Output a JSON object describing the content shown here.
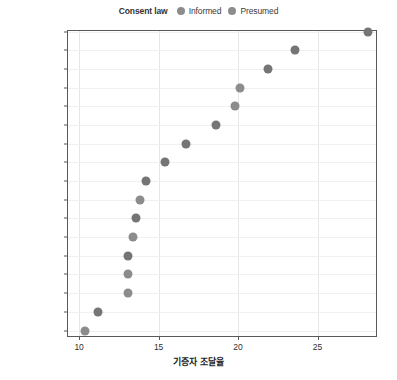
{
  "legend": {
    "title": "Consent law",
    "entries": [
      {
        "label": "Informed",
        "color": "#8c8c8c"
      },
      {
        "label": "Presumed",
        "color": "#8c8c8c"
      }
    ]
  },
  "axis": {
    "x_title": "기증자 조달율",
    "x_ticks": [
      "10",
      "15",
      "20",
      "25"
    ]
  },
  "chart_data": {
    "type": "scatter",
    "title": "",
    "xlabel": "기증자 조달율",
    "ylabel": "",
    "xlim": [
      9.3,
      28.8
    ],
    "grid": true,
    "legend_position": "top-center",
    "legend_title": "Consent law",
    "series": [
      {
        "name": "Informed",
        "color": "#8c8c8c"
      },
      {
        "name": "Presumed",
        "color": "#757575"
      }
    ],
    "categories": [
      "Spain",
      "Austria",
      "Belgium",
      "United States",
      "Ireland",
      "Finland",
      "France",
      "Norway",
      "Switzerland",
      "Canada",
      "Netherlands",
      "United Kingdom",
      "Sweden",
      "Denmark",
      "Germany",
      "Italy",
      "Australia"
    ],
    "points": [
      {
        "country": "Spain",
        "value": 28.2,
        "consent": "Presumed"
      },
      {
        "country": "Austria",
        "value": 23.6,
        "consent": "Presumed"
      },
      {
        "country": "Belgium",
        "value": 21.9,
        "consent": "Presumed"
      },
      {
        "country": "United States",
        "value": 20.1,
        "consent": "Informed"
      },
      {
        "country": "Ireland",
        "value": 19.8,
        "consent": "Informed"
      },
      {
        "country": "Finland",
        "value": 18.6,
        "consent": "Presumed"
      },
      {
        "country": "France",
        "value": 16.7,
        "consent": "Presumed"
      },
      {
        "country": "Norway",
        "value": 15.4,
        "consent": "Presumed"
      },
      {
        "country": "Switzerland",
        "value": 14.2,
        "consent": "Presumed"
      },
      {
        "country": "Canada",
        "value": 13.8,
        "consent": "Informed"
      },
      {
        "country": "Netherlands",
        "value": 13.6,
        "consent": "Presumed"
      },
      {
        "country": "United Kingdom",
        "value": 13.4,
        "consent": "Informed"
      },
      {
        "country": "Sweden",
        "value": 13.1,
        "consent": "Presumed"
      },
      {
        "country": "Denmark",
        "value": 13.1,
        "consent": "Informed"
      },
      {
        "country": "Germany",
        "value": 13.1,
        "consent": "Informed"
      },
      {
        "country": "Italy",
        "value": 11.2,
        "consent": "Presumed"
      },
      {
        "country": "Australia",
        "value": 10.4,
        "consent": "Informed"
      }
    ]
  }
}
